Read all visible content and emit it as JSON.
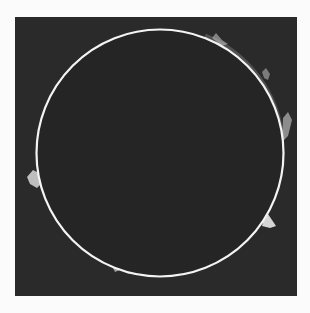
{
  "image": {
    "subject": "Solar disk with limb prominences",
    "background_color": "#fbfbfb",
    "frame": {
      "x": 15,
      "y": 17,
      "width": 282,
      "height": 279,
      "color": "#2a2a2a"
    },
    "disk": {
      "cx": 160,
      "cy": 153,
      "r": 123.5,
      "fill": "#252525",
      "limb_color": "#f4f4f4",
      "limb_width": 2.2
    },
    "prominences": [
      {
        "name": "west-limb-loop",
        "path": "M27,177 L33,170 L41,174 L42,183 L37,188 L30,184 Z",
        "fill": "#d8d8d8",
        "opacity": 0.85
      },
      {
        "name": "east-limb-spike",
        "path": "M263,222 L268,214 L276,226 L270,228 L262,226 Z",
        "fill": "#e8e8e8",
        "opacity": 0.9
      },
      {
        "name": "north-east-arc-1",
        "path": "M212,38 L216,33 L222,40 L228,44 L222,46 Z",
        "fill": "#bdbdbd",
        "opacity": 0.6
      },
      {
        "name": "north-east-arc-2",
        "path": "M262,72 L266,68 L270,74 L268,80 L264,78 Z",
        "fill": "#bdbdbd",
        "opacity": 0.55
      },
      {
        "name": "east-upper-loop",
        "path": "M283,118 L288,112 L292,120 L288,136 L282,142 Z",
        "fill": "#cfcfcf",
        "opacity": 0.6
      },
      {
        "name": "south-limb-blob",
        "path": "M112,266 L116,264 L120,270 L115,272 Z",
        "fill": "#cfcfcf",
        "opacity": 0.7
      },
      {
        "name": "south-limb-blob-2",
        "path": "M125,270 L130,268 L133,273 L128,274 Z",
        "fill": "#bcbcbc",
        "opacity": 0.6
      }
    ],
    "glow_arcs": [
      {
        "name": "ne-limb-glow",
        "path": "M205,36 A123.5,123.5 0 0,1 282,140",
        "stroke": "#9a9a9a",
        "width": 5,
        "opacity": 0.35
      }
    ]
  }
}
